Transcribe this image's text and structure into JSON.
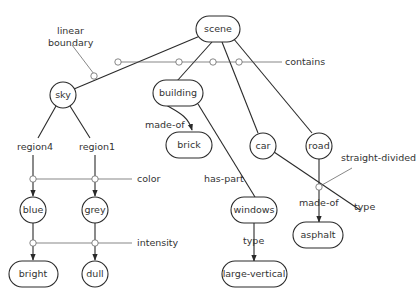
{
  "diagram": {
    "type": "semantic-network",
    "nodes": {
      "scene": "scene",
      "sky": "sky",
      "building": "building",
      "brick": "brick",
      "car": "car",
      "road": "road",
      "windows": "windows",
      "asphalt": "asphalt",
      "large_vertical": "large-vertical",
      "blue": "blue",
      "grey": "grey",
      "bright": "bright",
      "dull": "dull"
    },
    "edge_labels": {
      "linear_boundary_1": "linear",
      "linear_boundary_2": "boundary",
      "contains": "contains",
      "made_of_brick": "made-of",
      "region4": "region4",
      "region1": "region1",
      "color": "color",
      "intensity": "intensity",
      "has_part": "has-part",
      "straight_divided": "straight-divided",
      "made_of_asphalt": "made-of",
      "type_car": "type",
      "type_windows": "type"
    },
    "edges": [
      {
        "from": "scene",
        "to": "sky",
        "relation": "contains"
      },
      {
        "from": "scene",
        "to": "building",
        "relation": "contains"
      },
      {
        "from": "scene",
        "to": "car",
        "relation": "contains"
      },
      {
        "from": "scene",
        "to": "road",
        "relation": "contains"
      },
      {
        "from": "building",
        "to": "brick",
        "relation": "made-of"
      },
      {
        "from": "building",
        "to": "windows",
        "relation": "has-part"
      },
      {
        "from": "windows",
        "to": "large-vertical",
        "relation": "type"
      },
      {
        "from": "road",
        "to": "asphalt",
        "relation": "made-of"
      },
      {
        "from": "sky",
        "to": "blue",
        "relation": "region4"
      },
      {
        "from": "sky",
        "to": "grey",
        "relation": "region1"
      },
      {
        "from": "blue",
        "to": "bright",
        "relation": "intensity"
      },
      {
        "from": "grey",
        "to": "dull",
        "relation": "intensity"
      }
    ]
  }
}
